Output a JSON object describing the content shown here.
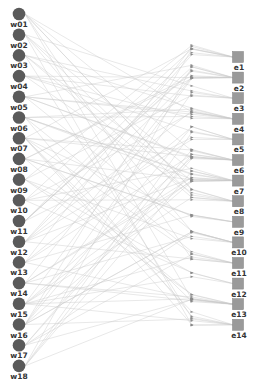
{
  "diagram": {
    "type": "bipartite-graph",
    "colors": {
      "background": "#ffffff",
      "left_node": "#5a5a5a",
      "right_node": "#9a9a9a",
      "right_node_border": "#808080",
      "edge": "#c8c8c8",
      "marker": "#8a8a8a",
      "label": "#333333"
    },
    "left_nodes": [
      "w01",
      "w02",
      "w03",
      "w04",
      "w05",
      "w06",
      "w07",
      "w08",
      "w09",
      "w10",
      "w11",
      "w12",
      "w13",
      "w14",
      "w15",
      "w16",
      "w17",
      "w18"
    ],
    "right_nodes": [
      "e1",
      "e2",
      "e3",
      "e4",
      "e5",
      "e6",
      "e7",
      "e8",
      "e9",
      "e10",
      "e11",
      "e12",
      "e13",
      "e14"
    ],
    "left_node_shape": "circle",
    "right_node_shape": "square",
    "middle_markers": "arrowheads"
  }
}
